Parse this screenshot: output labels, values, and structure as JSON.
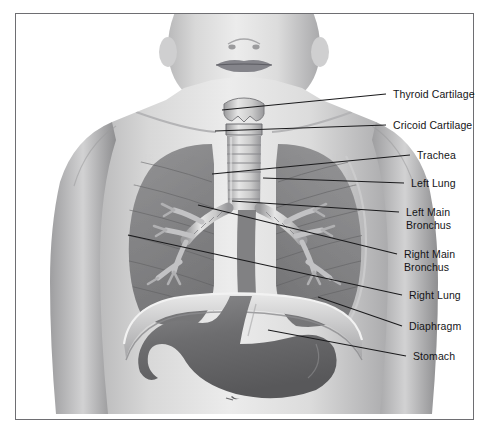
{
  "figure": {
    "border_color": "#6e6e72",
    "background_color": "#ffffff",
    "label_color": "#141416",
    "leader_color": "#1a1a1c"
  },
  "labels": [
    {
      "id": "thyroid-cartilage",
      "text": "Thyroid Cartilage",
      "text_x": 393,
      "text_y": 88,
      "leader": {
        "x1": 386,
        "y1": 94,
        "x2": 222,
        "y2": 110
      }
    },
    {
      "id": "cricoid-cartilage",
      "text": "Cricoid Cartilage",
      "text_x": 393,
      "text_y": 119,
      "leader": {
        "x1": 386,
        "y1": 125,
        "x2": 215,
        "y2": 131
      }
    },
    {
      "id": "trachea",
      "text": "Trachea",
      "text_x": 417,
      "text_y": 149,
      "leader": {
        "x1": 410,
        "y1": 155,
        "x2": 212,
        "y2": 174
      }
    },
    {
      "id": "left-lung",
      "text": "Left Lung",
      "text_x": 411,
      "text_y": 177,
      "leader": {
        "x1": 404,
        "y1": 183,
        "x2": 263,
        "y2": 178
      }
    },
    {
      "id": "left-main-bronchus",
      "text": "Left Main\nBronchus",
      "text_x": 406,
      "text_y": 206,
      "leader": {
        "x1": 399,
        "y1": 212,
        "x2": 232,
        "y2": 201
      }
    },
    {
      "id": "right-main-bronchus",
      "text": "Right Main\nBronchus",
      "text_x": 404,
      "text_y": 248,
      "leader": {
        "x1": 397,
        "y1": 254,
        "x2": 198,
        "y2": 205
      }
    },
    {
      "id": "right-lung",
      "text": "Right Lung",
      "text_x": 409,
      "text_y": 289,
      "leader": {
        "x1": 402,
        "y1": 295,
        "x2": 128,
        "y2": 235
      }
    },
    {
      "id": "diaphragm",
      "text": "Diaphragm",
      "text_x": 409,
      "text_y": 320,
      "leader": {
        "x1": 402,
        "y1": 326,
        "x2": 318,
        "y2": 297
      }
    },
    {
      "id": "stomach",
      "text": "Stomach",
      "text_x": 413,
      "text_y": 350,
      "leader": {
        "x1": 406,
        "y1": 356,
        "x2": 268,
        "y2": 330
      }
    }
  ],
  "structures": [
    {
      "id": "head",
      "name": "Lower face and neck"
    },
    {
      "id": "thyroid-cartilage-shape",
      "name": "Thyroid cartilage (laryngeal prominence)"
    },
    {
      "id": "cricoid-cartilage-shape",
      "name": "Cricoid cartilage ring"
    },
    {
      "id": "trachea-shape",
      "name": "Trachea with cartilage rings",
      "ring_count": 8
    },
    {
      "id": "right-lung-shape",
      "name": "Right lung"
    },
    {
      "id": "left-lung-shape",
      "name": "Left lung"
    },
    {
      "id": "bronchial-tree",
      "name": "Main bronchi and branches"
    },
    {
      "id": "diaphragm-shape",
      "name": "Diaphragm dome"
    },
    {
      "id": "stomach-shape",
      "name": "Stomach"
    },
    {
      "id": "navel",
      "name": "Navel"
    }
  ]
}
